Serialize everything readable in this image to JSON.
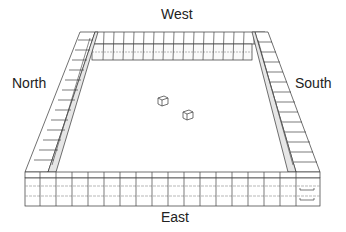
{
  "diagram": {
    "type": "isometric enclosure of stacked blocks",
    "labels": {
      "west": "West",
      "north": "North",
      "south": "South",
      "east": "East"
    },
    "objects": [
      {
        "name": "die-1",
        "shape": "cube"
      },
      {
        "name": "die-2",
        "shape": "cube"
      }
    ],
    "colors": {
      "stroke": "#333333",
      "background": "#ffffff",
      "texture": "#999999"
    }
  }
}
